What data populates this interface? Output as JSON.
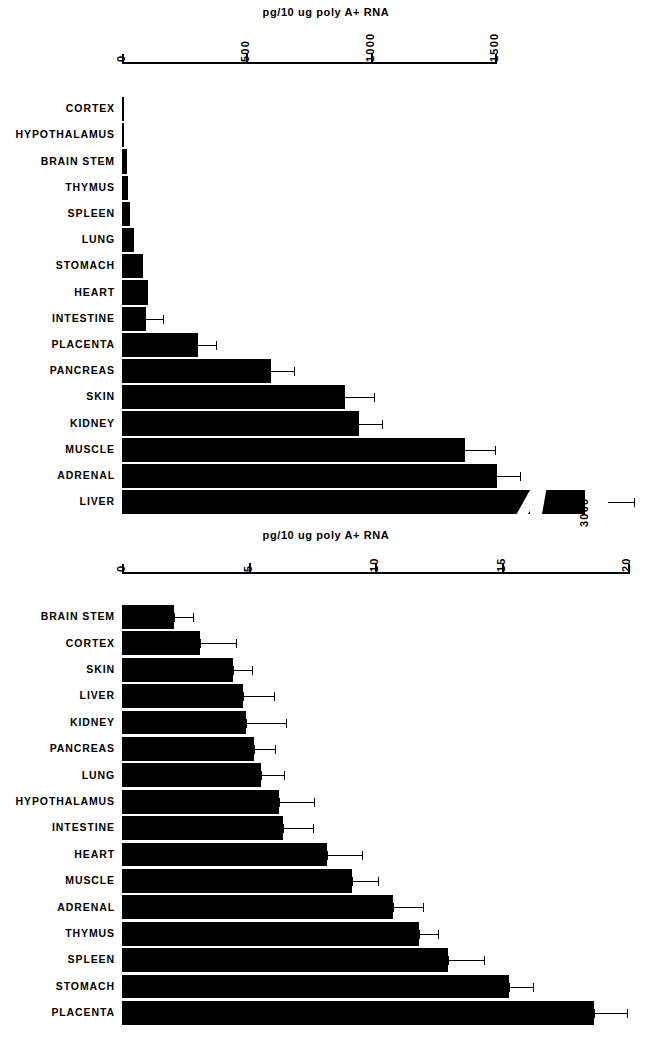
{
  "figure": {
    "background": "#ffffff",
    "ink": "#000000"
  },
  "panels": [
    {
      "id": "top-panel",
      "axis_title": "pg/10 ug poly A+ RNA",
      "tick_labels": [
        "0",
        "500",
        "1000",
        "1500"
      ],
      "break_label": "3000"
    },
    {
      "id": "bottom-panel",
      "axis_title": "pg/10 ug poly A+ RNA",
      "tick_labels": [
        "0",
        "5",
        "10",
        "15",
        "20"
      ]
    }
  ],
  "chart_data": [
    {
      "type": "bar",
      "orientation": "horizontal",
      "title": "",
      "xlabel": "pg/10 ug poly A+ RNA",
      "ylabel": "",
      "xlim": [
        0,
        1600
      ],
      "xticks": [
        0,
        500,
        1000,
        1500
      ],
      "grid": false,
      "legend": "none",
      "axis_break": {
        "at": 1650,
        "resumes_value": 3000,
        "label": "3000"
      },
      "categories": [
        "CORTEX",
        "HYPOTHALAMUS",
        "BRAIN STEM",
        "THYMUS",
        "SPLEEN",
        "LUNG",
        "STOMACH",
        "HEART",
        "INTESTINE",
        "PLACENTA",
        "PANCREAS",
        "SKIN",
        "KIDNEY",
        "MUSCLE",
        "ADRENAL",
        "LIVER"
      ],
      "values": [
        2,
        4,
        20,
        26,
        34,
        50,
        86,
        103,
        95,
        305,
        600,
        895,
        955,
        1380,
        1510,
        3000
      ],
      "errors": [
        0,
        0,
        0,
        0,
        0,
        0,
        0,
        0,
        70,
        75,
        90,
        120,
        90,
        120,
        90,
        130
      ],
      "notes": "LIVER bar is drawn with a broken axis; its plotted value is 3000."
    },
    {
      "type": "bar",
      "orientation": "horizontal",
      "title": "",
      "xlabel": "pg/10 ug poly A+ RNA",
      "ylabel": "",
      "xlim": [
        0,
        20
      ],
      "xticks": [
        0,
        5,
        10,
        15,
        20
      ],
      "grid": false,
      "legend": "none",
      "categories": [
        "BRAIN STEM",
        "CORTEX",
        "SKIN",
        "LIVER",
        "KIDNEY",
        "PANCREAS",
        "LUNG",
        "HYPOTHALAMUS",
        "INTESTINE",
        "HEART",
        "MUSCLE",
        "ADRENAL",
        "THYMUS",
        "SPLEEN",
        "STOMACH",
        "PLACENTA"
      ],
      "values": [
        2.05,
        3.1,
        4.4,
        4.8,
        4.9,
        5.2,
        5.5,
        6.2,
        6.35,
        8.1,
        9.1,
        10.7,
        11.75,
        12.9,
        15.3,
        18.65
      ],
      "errors": [
        0.75,
        1.4,
        0.75,
        1.2,
        1.6,
        0.85,
        0.9,
        1.4,
        1.2,
        1.4,
        1.0,
        1.2,
        0.75,
        1.4,
        0.95,
        1.3
      ]
    }
  ]
}
